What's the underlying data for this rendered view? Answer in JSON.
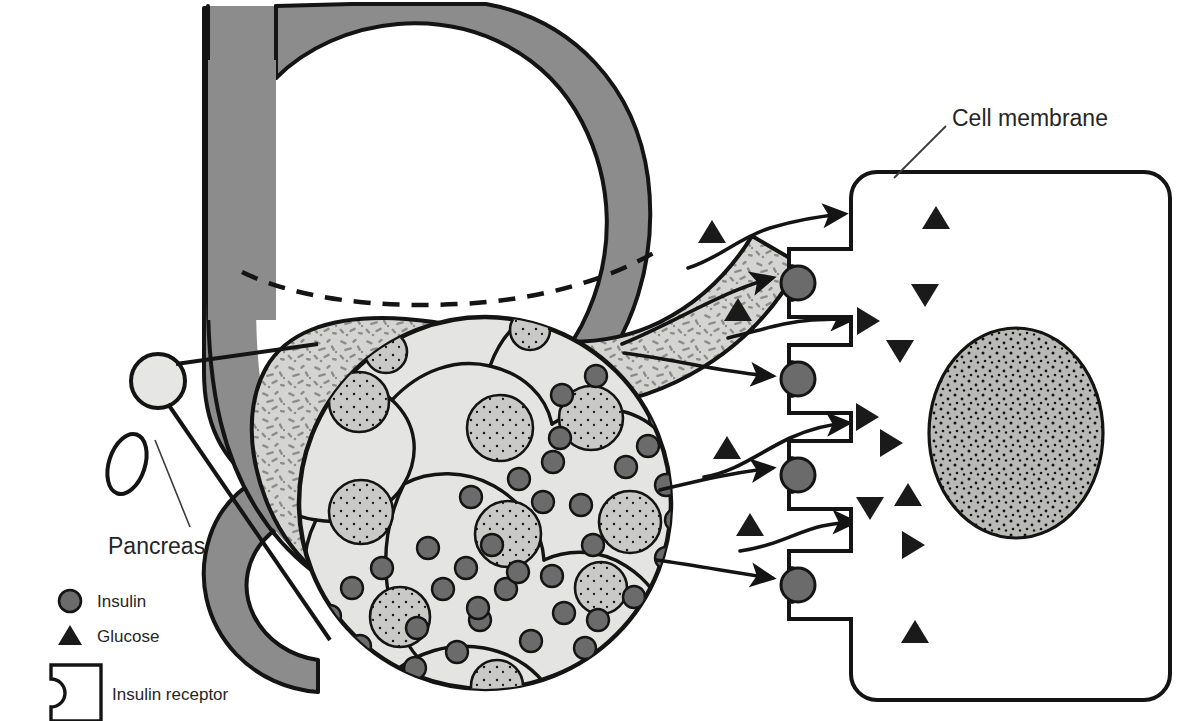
{
  "figure": {
    "domain": "biology-diagram"
  },
  "labels": {
    "pancreas": "Pancreas",
    "cell_membrane": "Cell membrane"
  },
  "legend": {
    "items": [
      {
        "key": "insulin",
        "label": "Insulin",
        "symbol": "filled-circle",
        "color": "#6b6b6b"
      },
      {
        "key": "glucose",
        "label": "Glucose",
        "symbol": "filled-triangle",
        "color": "#1a1a1a"
      },
      {
        "key": "insulin_receptor",
        "label": "Insulin receptor",
        "symbol": "notched-square",
        "color": "#ffffff"
      }
    ]
  },
  "colors": {
    "stomach_fill": "#8c8c8c",
    "pancreas_fill": "#d4d4d2",
    "pancreas_speckle": "#8f8f8f",
    "islet_cell_fill": "#e4e4e2",
    "islet_nucleus_fill": "#c9c9c7",
    "insulin_granule": "#6b6b6b",
    "glucose": "#1a1a1a",
    "nucleus_fill": "#b9b9b7",
    "outline": "#1a1a1a",
    "background": "#ffffff"
  },
  "organs": {
    "stomach": {
      "name": "stomach",
      "shaded": true
    },
    "esophagus": {
      "name": "esophagus"
    },
    "duodenum": {
      "name": "duodenum"
    },
    "pancreas": {
      "name": "pancreas",
      "speckled": true
    },
    "islet_marker": {
      "name": "islet-of-langerhans-marker"
    }
  },
  "islet": {
    "name": "islet-of-langerhans",
    "center": [
      485,
      503
    ],
    "radius": 186,
    "cell_count": 9,
    "nuclei": [
      {
        "cx": 386,
        "cy": 352,
        "r": 21
      },
      {
        "cx": 530,
        "cy": 330,
        "r": 20
      },
      {
        "cx": 359,
        "cy": 402,
        "r": 30
      },
      {
        "cx": 500,
        "cy": 428,
        "r": 33
      },
      {
        "cx": 591,
        "cy": 418,
        "r": 32
      },
      {
        "cx": 361,
        "cy": 512,
        "r": 32
      },
      {
        "cx": 508,
        "cy": 534,
        "r": 33
      },
      {
        "cx": 630,
        "cy": 522,
        "r": 31
      },
      {
        "cx": 400,
        "cy": 617,
        "r": 30
      },
      {
        "cx": 497,
        "cy": 686,
        "r": 26
      },
      {
        "cx": 601,
        "cy": 588,
        "r": 26
      }
    ],
    "granule_count": 46,
    "granule_radius": 11
  },
  "target_cell": {
    "name": "target-cell",
    "rect": {
      "x": 851,
      "y": 172,
      "width": 319,
      "height": 528,
      "radius": 26
    },
    "nucleus": {
      "cx": 1016,
      "cy": 433,
      "rx": 87,
      "ry": 105
    },
    "nucleus_speckles": 190,
    "glucose_inside": [
      {
        "x": 936,
        "y": 218,
        "rot": 0
      },
      {
        "x": 925,
        "y": 295,
        "rot": 180
      },
      {
        "x": 868,
        "y": 321,
        "rot": 90
      },
      {
        "x": 900,
        "y": 351,
        "rot": 180
      },
      {
        "x": 867,
        "y": 417,
        "rot": 90
      },
      {
        "x": 891,
        "y": 443,
        "rot": 90
      },
      {
        "x": 908,
        "y": 495,
        "rot": 0
      },
      {
        "x": 870,
        "y": 508,
        "rot": 180
      },
      {
        "x": 913,
        "y": 545,
        "rot": 90
      },
      {
        "x": 915,
        "y": 632,
        "rot": 0
      }
    ]
  },
  "receptors": [
    {
      "name": "insulin-receptor-1",
      "x": 789,
      "y": 275
    },
    {
      "name": "insulin-receptor-2",
      "x": 789,
      "y": 375
    },
    {
      "name": "insulin-receptor-3",
      "x": 789,
      "y": 466
    },
    {
      "name": "insulin-receptor-4",
      "x": 789,
      "y": 575
    }
  ],
  "glucose_outside": [
    {
      "x": 712,
      "y": 232,
      "rot": 0
    },
    {
      "x": 738,
      "y": 310,
      "rot": 0
    },
    {
      "x": 727,
      "y": 448,
      "rot": 0
    },
    {
      "x": 750,
      "y": 525,
      "rot": 0
    }
  ],
  "arrows": {
    "insulin_paths": 4,
    "glucose_paths": 4,
    "description": "curved arrows travelling from the islet to the insulin receptors and into the cell"
  }
}
